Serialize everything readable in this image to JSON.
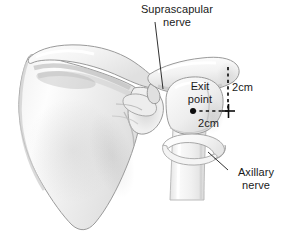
{
  "figure": {
    "view": "Anterior view of scapula, acromion and proximal humerus",
    "background_color": "#ffffff",
    "line_color": "#1a1a1a",
    "bone_fill_light": "#fdfdfd",
    "bone_fill_shade": "#e3e3e3",
    "bone_outline": "#8c8c8c"
  },
  "annotations": {
    "suprascapular_nerve": {
      "line1": "Suprascapular",
      "line2": "nerve"
    },
    "exit_point": {
      "line1": "Exit",
      "line2": "point"
    },
    "axillary_nerve": {
      "line1": "Axillary",
      "line2": "nerve"
    },
    "measurement_vertical": "2cm",
    "measurement_horizontal": "2cm"
  },
  "measurements": [
    {
      "name": "vertical-offset",
      "value": "2cm",
      "orientation": "vertical"
    },
    {
      "name": "horizontal-offset",
      "value": "2cm",
      "orientation": "horizontal"
    }
  ],
  "markers": {
    "exit_point_dot": "filled-dot",
    "crosshair": "plus-marker"
  }
}
